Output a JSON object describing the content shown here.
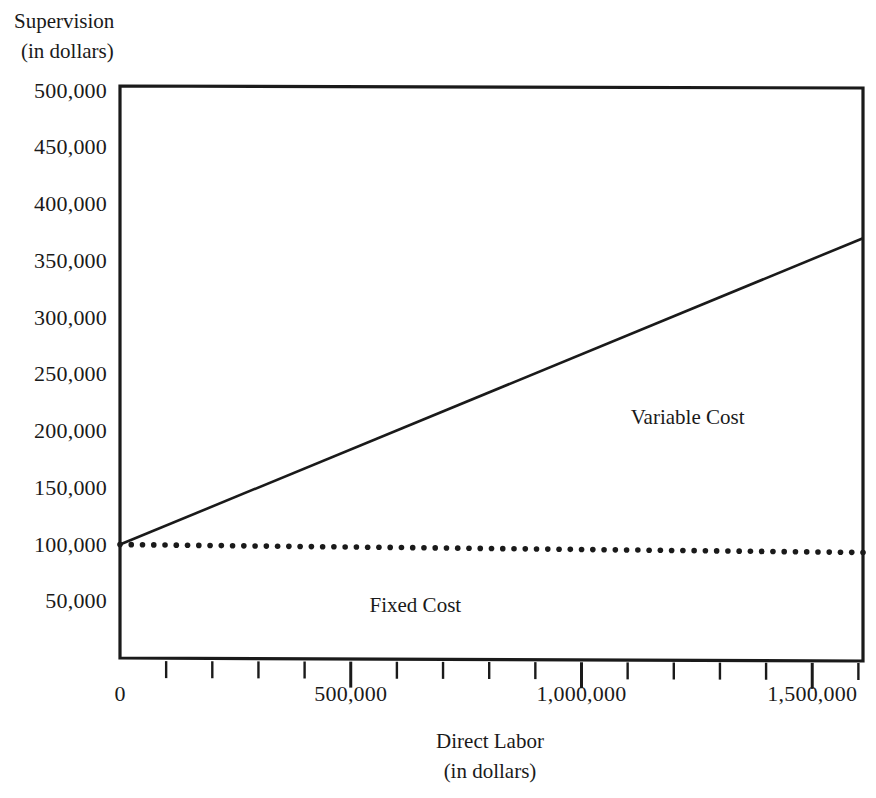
{
  "chart_data": {
    "type": "line",
    "title": "",
    "ylabel_line1": "Supervision",
    "ylabel_line2": "(in dollars)",
    "xlabel_line1": "Direct Labor",
    "xlabel_line2": "(in dollars)",
    "xlim": [
      0,
      1610000
    ],
    "ylim": [
      0,
      505000
    ],
    "grid": false,
    "legend": "none",
    "y_ticks": [
      {
        "value": 500000,
        "label": "500,000"
      },
      {
        "value": 450000,
        "label": "450,000"
      },
      {
        "value": 400000,
        "label": "400,000"
      },
      {
        "value": 350000,
        "label": "350,000"
      },
      {
        "value": 300000,
        "label": "300,000"
      },
      {
        "value": 250000,
        "label": "250,000"
      },
      {
        "value": 200000,
        "label": "200,000"
      },
      {
        "value": 150000,
        "label": "150,000"
      },
      {
        "value": 100000,
        "label": "100,000"
      },
      {
        "value": 50000,
        "label": "50,000"
      }
    ],
    "x_ticks": [
      {
        "value": 0,
        "label": "0",
        "major": true
      },
      {
        "value": 100000,
        "label": "",
        "major": false
      },
      {
        "value": 200000,
        "label": "",
        "major": false
      },
      {
        "value": 300000,
        "label": "",
        "major": false
      },
      {
        "value": 400000,
        "label": "",
        "major": false
      },
      {
        "value": 500000,
        "label": "500,000",
        "major": true
      },
      {
        "value": 600000,
        "label": "",
        "major": false
      },
      {
        "value": 700000,
        "label": "",
        "major": false
      },
      {
        "value": 800000,
        "label": "",
        "major": false
      },
      {
        "value": 900000,
        "label": "",
        "major": false
      },
      {
        "value": 1000000,
        "label": "1,000,000",
        "major": true
      },
      {
        "value": 1100000,
        "label": "",
        "major": false
      },
      {
        "value": 1200000,
        "label": "",
        "major": false
      },
      {
        "value": 1300000,
        "label": "",
        "major": false
      },
      {
        "value": 1400000,
        "label": "",
        "major": false
      },
      {
        "value": 1500000,
        "label": "1,500,000",
        "major": true
      },
      {
        "value": 1600000,
        "label": "",
        "major": false
      }
    ],
    "series": [
      {
        "name": "Variable Cost",
        "style": "solid",
        "annotation": "Variable Cost",
        "annotation_x": 1230000,
        "annotation_y": 212000,
        "x": [
          0,
          1610000
        ],
        "values": [
          100000,
          370000
        ]
      },
      {
        "name": "Fixed Cost",
        "style": "dotted",
        "annotation": "Fixed Cost",
        "annotation_x": 640000,
        "annotation_y": 47000,
        "x": [
          0,
          1610000
        ],
        "values": [
          100000,
          93000
        ]
      }
    ],
    "colors": {
      "line": "#1a1a1a",
      "axis": "#1a1a1a",
      "background": "#ffffff",
      "text": "#1a1a1a"
    }
  }
}
